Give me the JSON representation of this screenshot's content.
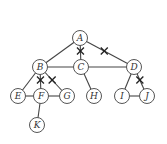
{
  "graph": {
    "nodes": [
      {
        "id": "A",
        "label": "A",
        "x": 80,
        "y": 38
      },
      {
        "id": "B",
        "label": "B",
        "x": 40,
        "y": 67
      },
      {
        "id": "C",
        "label": "C",
        "x": 81,
        "y": 67
      },
      {
        "id": "D",
        "label": "D",
        "x": 134,
        "y": 67
      },
      {
        "id": "E",
        "label": "E",
        "x": 18,
        "y": 96
      },
      {
        "id": "F",
        "label": "F",
        "x": 41,
        "y": 96
      },
      {
        "id": "G",
        "label": "G",
        "x": 67,
        "y": 96
      },
      {
        "id": "H",
        "label": "H",
        "x": 94,
        "y": 96
      },
      {
        "id": "I",
        "label": "I",
        "x": 122,
        "y": 96
      },
      {
        "id": "J",
        "label": "J",
        "x": 147,
        "y": 96
      },
      {
        "id": "K",
        "label": "K",
        "x": 37,
        "y": 125
      }
    ],
    "edges": [
      {
        "from": "A",
        "to": "B",
        "cut": false
      },
      {
        "from": "A",
        "to": "C",
        "cut": true
      },
      {
        "from": "A",
        "to": "D",
        "cut": true
      },
      {
        "from": "B",
        "to": "C",
        "cut": false
      },
      {
        "from": "C",
        "to": "D",
        "cut": false
      },
      {
        "from": "B",
        "to": "E",
        "cut": false
      },
      {
        "from": "B",
        "to": "F",
        "cut": true
      },
      {
        "from": "B",
        "to": "G",
        "cut": true
      },
      {
        "from": "E",
        "to": "F",
        "cut": false
      },
      {
        "from": "F",
        "to": "G",
        "cut": false
      },
      {
        "from": "F",
        "to": "K",
        "cut": false
      },
      {
        "from": "C",
        "to": "H",
        "cut": false
      },
      {
        "from": "D",
        "to": "I",
        "cut": false
      },
      {
        "from": "D",
        "to": "J",
        "cut": true
      },
      {
        "from": "I",
        "to": "J",
        "cut": false
      }
    ],
    "node_radius": 7.5
  }
}
